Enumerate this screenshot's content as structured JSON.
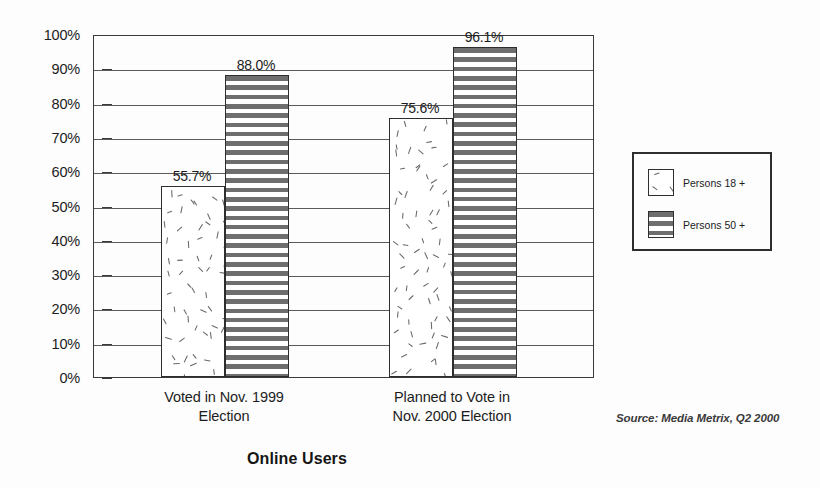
{
  "chart_data": {
    "type": "bar",
    "title": "Online Users",
    "xlabel": "",
    "ylabel": "",
    "ylim": [
      0,
      100
    ],
    "grid": true,
    "legend_position": "right",
    "categories": [
      "Voted in Nov. 1999\nElection",
      "Planned to Vote in\nNov. 2000 Election"
    ],
    "series": [
      {
        "name": "Persons 18 +",
        "values": [
          55.7,
          75.6
        ],
        "pattern": "scattered-dashes",
        "labels": [
          "55.7%",
          "75.6%"
        ]
      },
      {
        "name": "Persons 50 +",
        "values": [
          88.0,
          96.1
        ],
        "pattern": "horizontal-stripes",
        "labels": [
          "88.0%",
          "96.1%"
        ]
      }
    ],
    "ytick_labels": [
      "100%",
      "90%",
      "80%",
      "70%",
      "60%",
      "50%",
      "40%",
      "30%",
      "20%",
      "10%",
      "0%"
    ],
    "ytick_values": [
      100,
      90,
      80,
      70,
      60,
      50,
      40,
      30,
      20,
      10,
      0
    ],
    "annotations": [
      "Source: Media Metrix, Q2 2000"
    ],
    "colors": {
      "stripe_dark": "#6e6e6e",
      "bar_outline": "#2e2e2e",
      "gridline": "#5a5a5a",
      "text": "#1c1c1c",
      "background": "#fdfdfd"
    }
  },
  "source_note": "Source: Media Metrix, Q2 2000",
  "legend": {
    "items": [
      {
        "label": "Persons 18 +"
      },
      {
        "label": "Persons 50 +"
      }
    ]
  }
}
